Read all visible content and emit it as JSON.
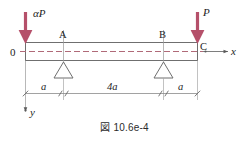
{
  "figure": {
    "caption_mark": "図",
    "caption_text": "10.6e-4",
    "colors": {
      "load_arrow": "#b5506a",
      "beam_outline": "#6f6f6f",
      "centerline": "#9a5a6a",
      "dimension_line": "#8a8a8a",
      "text": "#1d1d1d"
    }
  },
  "beam": {
    "origin_label": "0",
    "node_labels": {
      "a": "A",
      "b": "B",
      "c": "C"
    }
  },
  "axes": {
    "x_label": "x",
    "y_label": "y"
  },
  "loads": [
    {
      "name": "left-load",
      "label": "αP",
      "position": "left-end",
      "direction": "down"
    },
    {
      "name": "right-load",
      "label": "P",
      "position": "right-end",
      "direction": "down"
    }
  ],
  "supports": [
    {
      "name": "support-a",
      "type": "pin",
      "at": "A"
    },
    {
      "name": "support-b",
      "type": "pin",
      "at": "B"
    }
  ],
  "dimensions": [
    {
      "name": "dim-left",
      "label": "a",
      "span": "0 to A"
    },
    {
      "name": "dim-middle",
      "label": "4a",
      "span": "A to B"
    },
    {
      "name": "dim-right",
      "label": "a",
      "span": "B to C"
    }
  ]
}
